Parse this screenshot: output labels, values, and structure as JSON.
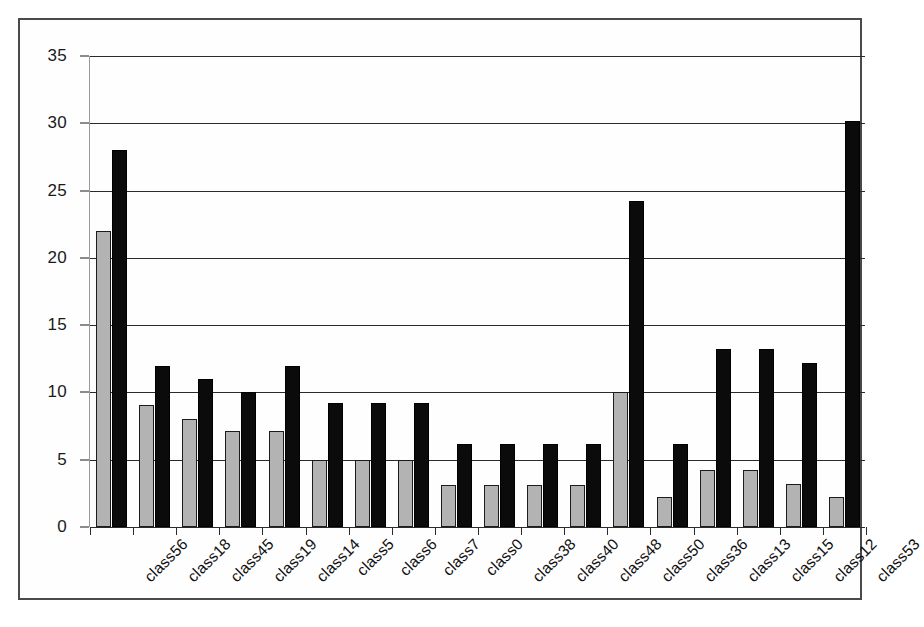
{
  "chart_data": {
    "type": "bar",
    "title": "",
    "subtitle": "",
    "xlabel": "",
    "ylabel": "",
    "grid": true,
    "legend": "none",
    "ylim": [
      0,
      35
    ],
    "yticks": [
      0,
      5,
      10,
      15,
      20,
      25,
      30,
      35
    ],
    "ytick_labels": [
      "0",
      "5",
      "10",
      "15",
      "20",
      "25",
      "30",
      "35"
    ],
    "categories": [
      "class56",
      "class18",
      "class45",
      "class19",
      "class14",
      "class5",
      "class6",
      "class7",
      "class0",
      "class38",
      "class40",
      "class48",
      "class50",
      "class36",
      "class13",
      "class15",
      "class12",
      "class53"
    ],
    "series": [
      {
        "name": "series-gray",
        "color": "#b3b3b3",
        "values": [
          22,
          9.1,
          8,
          7.1,
          7.1,
          5,
          5,
          5,
          3.1,
          3.1,
          3.1,
          3.1,
          10,
          2.2,
          4.2,
          4.2,
          3.2,
          2.2
        ]
      },
      {
        "name": "series-black",
        "color": "#0b0b0b",
        "values": [
          28,
          12,
          11,
          10,
          12,
          9.2,
          9.2,
          9.2,
          6.2,
          6.2,
          6.2,
          6.2,
          24.2,
          6.2,
          13.2,
          13.2,
          12.2,
          30.2
        ]
      }
    ],
    "colors": {
      "axis": "#1a1a1a",
      "gridline": "#2b2b2b",
      "frame": "#4a4a4a",
      "background": "#ffffff",
      "series_gray": "#b3b3b3",
      "series_black": "#0b0b0b"
    }
  }
}
